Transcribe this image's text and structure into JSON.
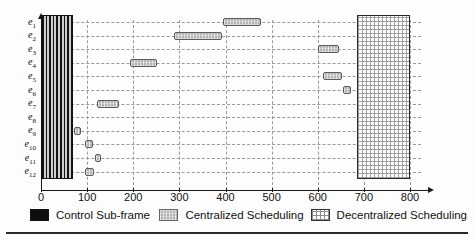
{
  "chart_data": {
    "type": "bar",
    "title": "",
    "subtitle": "",
    "xlabel": "",
    "ylabel": "",
    "orientation": "horizontal",
    "grid": true,
    "xlim": [
      0,
      830
    ],
    "xticks": [
      0,
      100,
      200,
      300,
      400,
      500,
      600,
      700,
      800
    ],
    "xticklabels": [
      "0",
      "100",
      "200",
      "300",
      "400",
      "500",
      "600",
      "700",
      "800"
    ],
    "categories": [
      "e1",
      "e2",
      "e3",
      "e4",
      "e5",
      "e6",
      "e7",
      "e8",
      "e9",
      "e10",
      "e11",
      "e12"
    ],
    "categorylabels": [
      "e",
      "e",
      "e",
      "e",
      "e",
      "e",
      "e",
      "e",
      "e",
      "e",
      "e",
      "e"
    ],
    "category_subscripts": [
      "1",
      "2",
      "3",
      "4",
      "5",
      "6",
      "7",
      "8",
      "9",
      "10",
      "11",
      "12"
    ],
    "legend_position": "bottom",
    "series": [
      {
        "name": "Control Sub-frame",
        "color": "#0d0d0d",
        "pattern": "vertical-stripes",
        "spans_all_rows": true,
        "bars": [
          {
            "row": "all",
            "start": 0,
            "end": 70
          }
        ]
      },
      {
        "name": "Centralized Scheduling",
        "color": "#b4b4b4",
        "pattern": "fine-grid",
        "bars": [
          {
            "row": "e1",
            "start": 395,
            "end": 478
          },
          {
            "row": "e2",
            "start": 288,
            "end": 393
          },
          {
            "row": "e3",
            "start": 600,
            "end": 645
          },
          {
            "row": "e4",
            "start": 192,
            "end": 252
          },
          {
            "row": "e5",
            "start": 612,
            "end": 652
          },
          {
            "row": "e6",
            "start": 655,
            "end": 672
          },
          {
            "row": "e7",
            "start": 122,
            "end": 170
          },
          {
            "row": "e9",
            "start": 71,
            "end": 87
          },
          {
            "row": "e10",
            "start": 96,
            "end": 112
          },
          {
            "row": "e11",
            "start": 116,
            "end": 130
          },
          {
            "row": "e12",
            "start": 96,
            "end": 114
          }
        ]
      },
      {
        "name": "Decentralized Scheduling",
        "color": "#ffffff",
        "pattern": "cross-hatch",
        "spans_all_rows": true,
        "bars": [
          {
            "row": "all",
            "start": 685,
            "end": 800
          }
        ]
      }
    ]
  },
  "legend": {
    "items": [
      {
        "label": "Control Sub-frame",
        "swatch": "control-subframe-swatch"
      },
      {
        "label": "Centralized Scheduling",
        "swatch": "centralized-swatch"
      },
      {
        "label": "Decentralized Scheduling",
        "swatch": "decentralized-swatch"
      }
    ]
  }
}
